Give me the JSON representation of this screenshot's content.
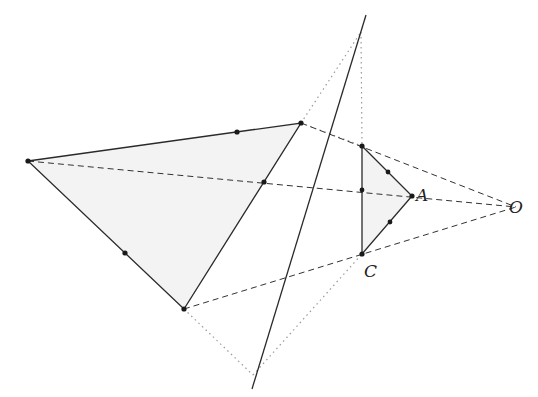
{
  "diagram": {
    "type": "perspective-homothety",
    "labels": {
      "A": "A",
      "C": "C",
      "O": "O"
    },
    "points": {
      "P1": [
        28,
        161
      ],
      "P2": [
        301,
        123
      ],
      "P3": [
        184,
        309
      ],
      "Q1": [
        362,
        146
      ],
      "A": [
        412,
        196
      ],
      "C": [
        362,
        254
      ],
      "O": [
        516,
        207
      ],
      "M1": [
        237,
        132
      ],
      "M2": [
        264,
        182
      ],
      "M3": [
        125,
        253
      ],
      "N1": [
        388,
        172
      ],
      "N2": [
        362,
        190
      ],
      "N3": [
        390,
        222
      ],
      "T": [
        361,
        32
      ],
      "B": [
        253,
        375
      ]
    },
    "axis_line": {
      "from": [
        366,
        15
      ],
      "to": [
        252,
        389
      ]
    },
    "colors": {
      "stroke": "#2a2a2a",
      "fill": "#f2f2f2",
      "dotted": "#9a9a9a"
    }
  }
}
